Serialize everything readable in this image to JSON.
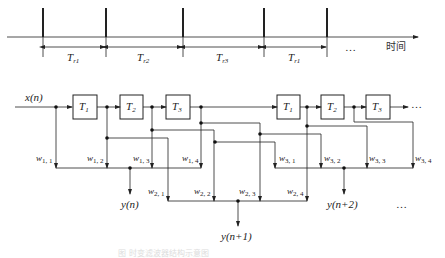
{
  "timeline": {
    "axis_label": "时间",
    "ellipsis": "…",
    "intervals": [
      {
        "label": "T",
        "sub": "r1"
      },
      {
        "label": "T",
        "sub": "r2"
      },
      {
        "label": "T",
        "sub": "r3"
      },
      {
        "label": "T",
        "sub": "r1"
      }
    ]
  },
  "filter": {
    "input": "x(n)",
    "ellipsis_top": "…",
    "ellipsis_bottom": "…",
    "delays": [
      {
        "label": "T",
        "sub": "1"
      },
      {
        "label": "T",
        "sub": "2"
      },
      {
        "label": "T",
        "sub": "3"
      },
      {
        "label": "T",
        "sub": "1"
      },
      {
        "label": "T",
        "sub": "2"
      },
      {
        "label": "T",
        "sub": "3"
      }
    ],
    "weights": {
      "w11": {
        "base": "w",
        "sub": "1, 1"
      },
      "w12": {
        "base": "w",
        "sub": "1, 2"
      },
      "w13": {
        "base": "w",
        "sub": "1, 3"
      },
      "w14": {
        "base": "w",
        "sub": "1, 4"
      },
      "w21": {
        "base": "w",
        "sub": "2, 1"
      },
      "w22": {
        "base": "w",
        "sub": "2, 2"
      },
      "w23": {
        "base": "w",
        "sub": "2, 3"
      },
      "w24": {
        "base": "w",
        "sub": "2, 4"
      },
      "w31": {
        "base": "w",
        "sub": "3, 1"
      },
      "w32": {
        "base": "w",
        "sub": "3, 2"
      },
      "w33": {
        "base": "w",
        "sub": "3, 3"
      },
      "w34": {
        "base": "w",
        "sub": "3, 4"
      }
    },
    "outputs": [
      "y(n)",
      "y(n+1)",
      "y(n+2)"
    ]
  },
  "caption": "图  时变滤波器结构示意图"
}
